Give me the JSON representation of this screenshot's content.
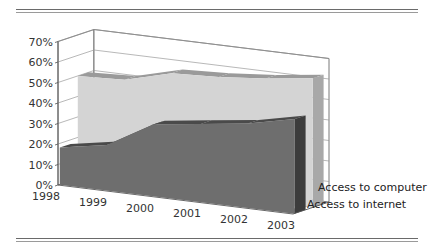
{
  "chart_data": {
    "type": "area",
    "subtype": "3d-area",
    "title": "",
    "xlabel": "",
    "ylabel": "",
    "categories": [
      "1998",
      "1999",
      "2000",
      "2001",
      "2002",
      "2003"
    ],
    "series": [
      {
        "name": "Access to computer",
        "values": [
          50,
          51,
          57,
          58,
          60,
          63
        ],
        "color": "#d4d4d4"
      },
      {
        "name": "Access to internet",
        "values": [
          18,
          22,
          35,
          38,
          41,
          46
        ],
        "color": "#6e6e6e"
      }
    ],
    "y_ticks": [
      "0%",
      "10%",
      "20%",
      "30%",
      "40%",
      "50%",
      "60%",
      "70%"
    ],
    "ylim": [
      0,
      70
    ],
    "grid": true,
    "legend_position": "series-labels-on-depth-axis"
  },
  "colors": {
    "computer_face": "#d4d4d4",
    "computer_top": "#9a9a9a",
    "computer_side": "#a8a8a8",
    "internet_face": "#6e6e6e",
    "internet_top": "#4a4a4a",
    "internet_side": "#3c3c3c",
    "floor": "#555555",
    "grid": "#9a9a9a",
    "axis": "#555555",
    "rule": "#6a6a6a"
  }
}
